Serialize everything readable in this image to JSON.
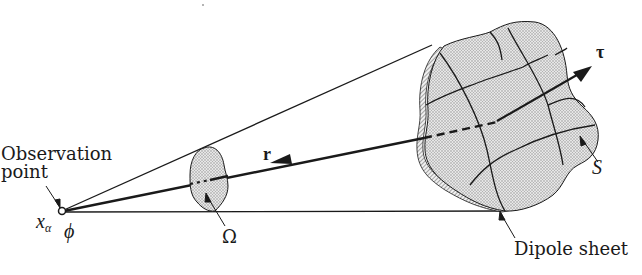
{
  "figure": {
    "type": "diagram",
    "colors": {
      "ink": "#1a1a1a",
      "fill": "#d9d9d9",
      "background": "#ffffff"
    }
  },
  "labels": {
    "observation_line1": "Observation",
    "observation_line2": "point",
    "x_alpha": "x",
    "x_alpha_sub": "α",
    "phi": "ϕ",
    "r": "r",
    "omega": "Ω",
    "tau": "τ",
    "S": "S",
    "dipole_sheet": "Dipole sheet"
  }
}
